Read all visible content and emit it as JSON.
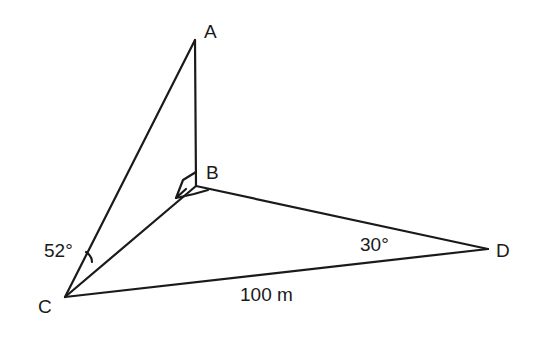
{
  "diagram": {
    "type": "3d-geometry-figure",
    "points": {
      "A": {
        "label": "A"
      },
      "B": {
        "label": "B"
      },
      "C": {
        "label": "C"
      },
      "D": {
        "label": "D"
      }
    },
    "segments": [
      "AB",
      "AC",
      "BC",
      "BD",
      "CD"
    ],
    "right_angle_at": "B",
    "angles": {
      "ACB": "52°",
      "BDC": "30°"
    },
    "lengths": {
      "CD": "100 m"
    },
    "line_color": "#1a1a1a"
  }
}
